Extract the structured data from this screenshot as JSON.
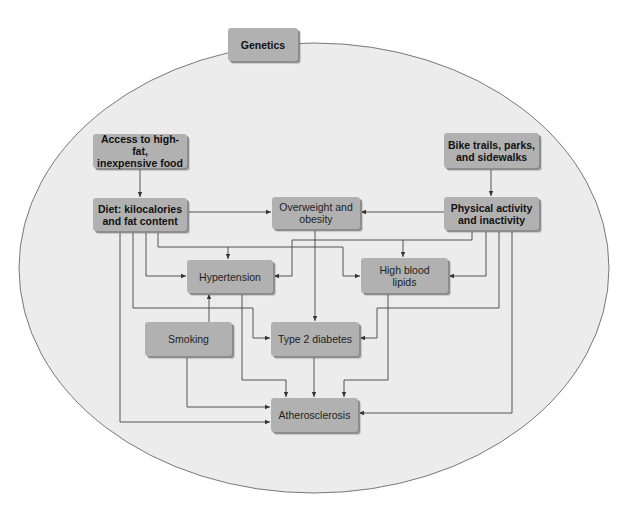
{
  "diagram": {
    "type": "flowchart",
    "enclosure": "Genetics",
    "nodes": {
      "genetics": "Genetics",
      "access_food": "Access to high-fat,\ninexpensive food",
      "bike_trails": "Bike trails, parks,\nand sidewalks",
      "diet": "Diet: kilocalories\nand fat content",
      "overweight": "Overweight and\nobesity",
      "physical_activity": "Physical activity\nand inactivity",
      "hypertension": "Hypertension",
      "high_blood_lipids": "High blood\nlipids",
      "smoking": "Smoking",
      "type2_diabetes": "Type 2 diabetes",
      "atherosclerosis": "Atherosclerosis"
    },
    "edges": [
      {
        "from": "access_food",
        "to": "diet"
      },
      {
        "from": "bike_trails",
        "to": "physical_activity"
      },
      {
        "from": "diet",
        "to": "overweight"
      },
      {
        "from": "physical_activity",
        "to": "overweight"
      },
      {
        "from": "diet",
        "to": "hypertension"
      },
      {
        "from": "diet",
        "to": "high_blood_lipids"
      },
      {
        "from": "diet",
        "to": "type2_diabetes"
      },
      {
        "from": "diet",
        "to": "atherosclerosis"
      },
      {
        "from": "physical_activity",
        "to": "hypertension"
      },
      {
        "from": "physical_activity",
        "to": "high_blood_lipids"
      },
      {
        "from": "physical_activity",
        "to": "type2_diabetes"
      },
      {
        "from": "physical_activity",
        "to": "atherosclerosis"
      },
      {
        "from": "overweight",
        "to": "type2_diabetes"
      },
      {
        "from": "smoking",
        "to": "hypertension"
      },
      {
        "from": "smoking",
        "to": "atherosclerosis"
      },
      {
        "from": "hypertension",
        "to": "atherosclerosis"
      },
      {
        "from": "type2_diabetes",
        "to": "atherosclerosis"
      },
      {
        "from": "high_blood_lipids",
        "to": "atherosclerosis"
      }
    ],
    "colors": {
      "box_fill": "#b1b1b1",
      "box_shadow": "#8d8d8d",
      "ellipse_fill": "#ececec",
      "ellipse_stroke": "#6a6a6a",
      "line": "#444444"
    }
  }
}
